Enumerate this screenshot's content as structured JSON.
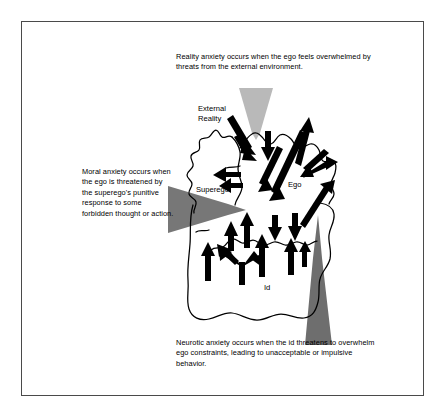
{
  "figure": {
    "frame": {
      "border_color": "#4a4a4a"
    },
    "background": "#ffffff",
    "captions": {
      "reality": "Reality anxiety occurs when the ego feels overwhelmed by threats from the external environment.",
      "moral": "Moral anxiety occurs when the ego is threatened by the superego's punitive response to some forbidden thought or action.",
      "neurotic": "Neurotic anxiety occurs when the id threatens to overwhelm ego constraints, leading to unacceptable or impulsive behavior."
    },
    "labels": {
      "external_reality": "External\nReality",
      "superego": "Superego",
      "ego": "Ego",
      "id": "Id"
    },
    "colors": {
      "outline": "#000000",
      "black_arrow": "#000000",
      "reality_arrow": "#b9b9b9",
      "moral_arrow": "#777777",
      "neurotic_arrow": "#6e6e6e",
      "text": "#000000"
    },
    "pressure_arrows": [
      {
        "name": "reality-anxiety-arrow",
        "direction": "down",
        "color": "#b9b9b9",
        "points_at": "ego"
      },
      {
        "name": "moral-anxiety-arrow",
        "direction": "right",
        "color": "#777777",
        "points_at": "ego"
      },
      {
        "name": "neurotic-anxiety-arrow",
        "direction": "up",
        "color": "#6e6e6e",
        "points_at": "ego"
      }
    ]
  }
}
